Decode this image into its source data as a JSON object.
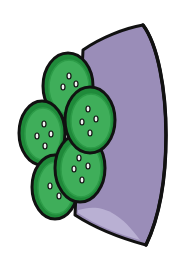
{
  "illustration": {
    "subject": "Bowl of green buttons",
    "colors": {
      "background": "#ffffff",
      "bowl_fill": "#9a8db8",
      "bowl_highlight": "#b9b0d3",
      "outline": "#111111",
      "button_dark": "#1f8a3a",
      "button_light": "#3fae5a",
      "button_rim": "#2d9c48",
      "button_hole": "#f2f2f2"
    },
    "buttons": [
      {
        "name": "button-top",
        "cx": 68,
        "cy": 86,
        "rx": 25,
        "ry": 33,
        "holes": [
          [
            69,
            76
          ],
          [
            63,
            87
          ],
          [
            76,
            84
          ]
        ]
      },
      {
        "name": "button-left",
        "cx": 42,
        "cy": 133,
        "rx": 23,
        "ry": 32,
        "holes": [
          [
            44,
            124
          ],
          [
            37,
            136
          ],
          [
            51,
            134
          ],
          [
            45,
            146
          ]
        ]
      },
      {
        "name": "button-bottom-left",
        "cx": 55,
        "cy": 187,
        "rx": 23,
        "ry": 32,
        "holes": [
          [
            50,
            186
          ],
          [
            59,
            196
          ]
        ]
      },
      {
        "name": "button-bottom-mid",
        "cx": 80,
        "cy": 168,
        "rx": 25,
        "ry": 34,
        "holes": [
          [
            79,
            158
          ],
          [
            74,
            169
          ],
          [
            88,
            166
          ],
          [
            82,
            180
          ]
        ]
      },
      {
        "name": "button-mid-right",
        "cx": 90,
        "cy": 120,
        "rx": 25,
        "ry": 33,
        "holes": [
          [
            88,
            109
          ],
          [
            82,
            122
          ],
          [
            96,
            119
          ],
          [
            90,
            133
          ]
        ]
      }
    ]
  }
}
